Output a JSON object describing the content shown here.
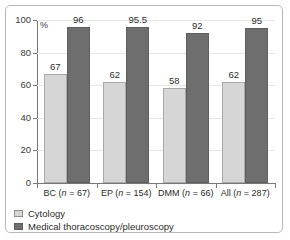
{
  "chart_data": {
    "type": "bar",
    "title": "",
    "xlabel": "",
    "ylabel": "%",
    "ylim": [
      0,
      100
    ],
    "yticks": [
      0,
      20,
      40,
      60,
      80,
      100
    ],
    "grid": true,
    "legend_position": "bottom-left",
    "categories": [
      "BC (n = 67)",
      "EP (n = 154)",
      "DMM (n = 66)",
      "All (n = 287)"
    ],
    "category_parts": [
      {
        "name": "BC",
        "n": "67"
      },
      {
        "name": "EP",
        "n": "154"
      },
      {
        "name": "DMM",
        "n": "66"
      },
      {
        "name": "All",
        "n": "287"
      }
    ],
    "series": [
      {
        "name": "Cytology",
        "color": "#d6d6d6",
        "values": [
          67,
          62,
          58,
          62
        ],
        "labels": [
          "67",
          "62",
          "58",
          "62"
        ]
      },
      {
        "name": "Medical thoracoscopy/pleuroscopy",
        "color": "#6e6e6e",
        "values": [
          96,
          95.5,
          92,
          95
        ],
        "labels": [
          "96",
          "95.5",
          "92",
          "95"
        ]
      }
    ]
  },
  "axis": {
    "unit_label": "%",
    "tick_labels": [
      "100",
      "80",
      "60",
      "40",
      "20",
      "0"
    ]
  },
  "legend": {
    "items": [
      {
        "label": "Cytology",
        "swatch": "light"
      },
      {
        "label": "Medical thoracoscopy/pleuroscopy",
        "swatch": "dark"
      }
    ]
  }
}
